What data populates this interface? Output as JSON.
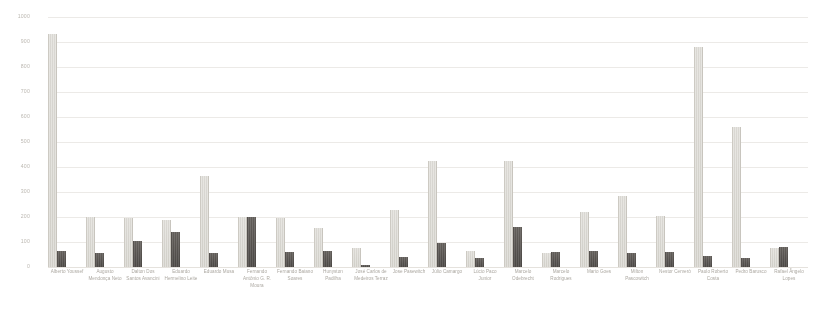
{
  "chart_data": {
    "type": "bar",
    "title": "",
    "subtitle": "",
    "xlabel": "",
    "ylabel": "",
    "ylim": [
      0,
      1000
    ],
    "yticks": [
      0,
      100,
      200,
      300,
      400,
      500,
      600,
      700,
      800,
      900,
      1000
    ],
    "ytick_labels": [
      "0",
      "100",
      "200",
      "300",
      "400",
      "500",
      "600",
      "700",
      "800",
      "900",
      "1000"
    ],
    "grid": true,
    "legend_position": "none",
    "grouping": "grouped",
    "categories": [
      "Alberto Youssef",
      "Augusto Mendonça Neto",
      "Dalton Dos Santos Avancini",
      "Eduardo Hermelino Leite",
      "Eduardo Musa",
      "Fernando Antônio G. R. Moura",
      "Fernando Baiano Soares",
      "Hunyston Padilha",
      "José Carlos de Medeiros Terraz",
      "Jose Pasewitch",
      "Júlio Camargo",
      "Lúcio Paco Junior",
      "Marcelo Odebrecht",
      "Marcelo Rodrigues",
      "Mario Goes",
      "Milton Pascowitch",
      "Nestor Cerveró",
      "Paulo Roberto Costa",
      "Pedro Barusco",
      "Rafael Ângelo Lopes"
    ],
    "series": [
      {
        "name": "series-1",
        "color": "#d4d2cc",
        "values": [
          932,
          200,
          195,
          190,
          365,
          200,
          195,
          155,
          75,
          230,
          425,
          65,
          425,
          55,
          220,
          285,
          205,
          880,
          560,
          75
        ]
      },
      {
        "name": "series-2",
        "color": "#464340",
        "values": [
          65,
          55,
          105,
          140,
          55,
          200,
          60,
          65,
          10,
          40,
          95,
          35,
          160,
          60,
          65,
          55,
          60,
          45,
          35,
          80
        ]
      }
    ]
  },
  "colors": {
    "series_1": "#d4d2cc",
    "series_2": "#464340",
    "gridline": "#eceae6",
    "tick_text": "#b9b5ae",
    "label_text": "#a8a49d",
    "background": "#ffffff"
  }
}
